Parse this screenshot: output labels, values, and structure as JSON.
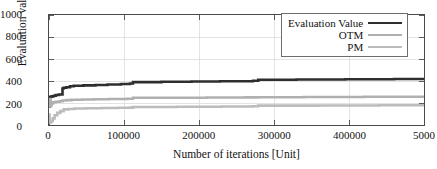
{
  "chart_data": {
    "type": "line",
    "title": "",
    "xlabel": "Number of iterations [Unit]",
    "ylabel": "Evaluation value [Unit]",
    "xlim": [
      0,
      500000
    ],
    "ylim": [
      0,
      1000
    ],
    "xticks": [
      0,
      100000,
      200000,
      300000,
      400000,
      500000
    ],
    "xtick_labels": [
      "0",
      "100000",
      "200000",
      "300000",
      "400000",
      "5000"
    ],
    "yticks": [
      0,
      200,
      400,
      600,
      800,
      1000
    ],
    "ytick_labels": [
      "0",
      "200",
      "400",
      "600",
      "800",
      "1000"
    ],
    "grid": true,
    "legend_position": "top-right",
    "legend": [
      "Evaluation Value",
      "OTM",
      "PM"
    ],
    "series": [
      {
        "name": "Evaluation Value",
        "color": "#2e2e2e",
        "width": 2.6,
        "x": [
          0,
          1200,
          1200,
          2600,
          2600,
          4200,
          4200,
          6500,
          6500,
          9000,
          9000,
          13000,
          13000,
          18000,
          18000,
          19500,
          19500,
          23000,
          23000,
          28000,
          28000,
          33000,
          33000,
          46000,
          46000,
          62000,
          62000,
          78000,
          78000,
          96000,
          96000,
          108000,
          108000,
          112000,
          112000,
          150000,
          150000,
          190000,
          190000,
          228000,
          228000,
          272000,
          272000,
          279000,
          279000,
          330000,
          330000,
          395000,
          395000,
          460000,
          460000,
          500000
        ],
        "y": [
          170,
          170,
          255,
          255,
          258,
          258,
          262,
          262,
          266,
          266,
          272,
          272,
          278,
          278,
          332,
          332,
          338,
          338,
          344,
          344,
          352,
          352,
          356,
          356,
          360,
          360,
          364,
          364,
          368,
          368,
          372,
          372,
          378,
          378,
          390,
          390,
          394,
          394,
          396,
          396,
          398,
          398,
          402,
          402,
          412,
          412,
          414,
          414,
          416,
          416,
          418,
          418
        ]
      },
      {
        "name": "OTM",
        "color": "#b0b0b0",
        "width": 2.6,
        "x": [
          0,
          1000,
          1000,
          2000,
          2000,
          3200,
          3200,
          5500,
          5500,
          9000,
          9000,
          14000,
          14000,
          18000,
          18000,
          23000,
          23000,
          30000,
          30000,
          44000,
          44000,
          60000,
          60000,
          80000,
          80000,
          104000,
          104000,
          112000,
          112000,
          160000,
          160000,
          210000,
          210000,
          262000,
          262000,
          279000,
          279000,
          340000,
          340000,
          420000,
          420000,
          500000
        ],
        "y": [
          175,
          175,
          235,
          235,
          172,
          172,
          196,
          196,
          206,
          206,
          212,
          212,
          216,
          216,
          222,
          222,
          226,
          226,
          230,
          230,
          232,
          232,
          234,
          234,
          236,
          236,
          238,
          238,
          247,
          247,
          248,
          248,
          250,
          250,
          251,
          251,
          253,
          253,
          254,
          254,
          256,
          256
        ]
      },
      {
        "name": "PM",
        "color": "#bcbcbc",
        "width": 2.6,
        "x": [
          0,
          800,
          800,
          1600,
          1600,
          2400,
          2400,
          3400,
          3400,
          5000,
          5000,
          7500,
          7500,
          11000,
          11000,
          15000,
          15000,
          19500,
          19500,
          26000,
          26000,
          34000,
          34000,
          50000,
          50000,
          70000,
          70000,
          92000,
          92000,
          108000,
          108000,
          112000,
          112000,
          170000,
          170000,
          230000,
          230000,
          272000,
          272000,
          279000,
          279000,
          360000,
          360000,
          440000,
          440000,
          500000
        ],
        "y": [
          95,
          95,
          24,
          24,
          22,
          22,
          30,
          30,
          36,
          36,
          60,
          60,
          88,
          88,
          110,
          110,
          126,
          126,
          142,
          142,
          146,
          146,
          150,
          150,
          152,
          152,
          154,
          154,
          156,
          156,
          158,
          158,
          164,
          164,
          166,
          166,
          168,
          168,
          170,
          170,
          176,
          176,
          178,
          178,
          180,
          180
        ]
      }
    ]
  },
  "axes": {
    "frame_color": "#4a4a4a",
    "grid_color": "#dcdcdc"
  }
}
